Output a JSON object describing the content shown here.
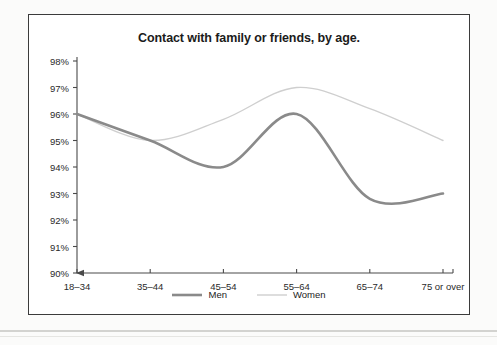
{
  "chart_data": {
    "type": "line",
    "title": "Contact with family or friends, by age.",
    "xlabel": "",
    "ylabel": "",
    "categories": [
      "18–34",
      "35–44",
      "45–54",
      "55–64",
      "65–74",
      "75 or over"
    ],
    "series": [
      {
        "name": "Men",
        "values": [
          96,
          95,
          94,
          96,
          92.8,
          93
        ],
        "color": "#8a8a8a",
        "width": 2.6
      },
      {
        "name": "Women",
        "values": [
          96,
          95,
          95.8,
          97,
          96.2,
          95
        ],
        "color": "#cfcfcf",
        "width": 1.4
      }
    ],
    "ylim": [
      90,
      98
    ],
    "yticks": [
      98,
      97,
      96,
      95,
      94,
      93,
      92,
      91,
      90
    ],
    "ytick_labels": [
      "98%",
      "97%",
      "96%",
      "95%",
      "94%",
      "93%",
      "92%",
      "91%",
      "90%"
    ],
    "grid": false,
    "legend_position": "bottom",
    "smoothing": "spline"
  },
  "legend": {
    "entries": [
      {
        "label": "Men"
      },
      {
        "label": "Women"
      }
    ]
  },
  "axes": {
    "y_axis_name": "percentage-axis",
    "x_axis_name": "age-group-axis"
  }
}
